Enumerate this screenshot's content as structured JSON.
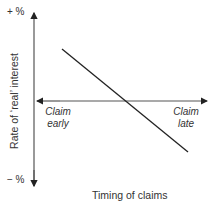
{
  "diagram": {
    "y_axis_label": "Rate of ‘real’ interest",
    "y_top_label": "+ %",
    "y_bottom_label": "− %",
    "x_axis_label": "Timing of claims",
    "x_left_label_line1": "Claim",
    "x_left_label_line2": "early",
    "x_right_label_line1": "Claim",
    "x_right_label_line2": "late",
    "line_description": "downward sloping line crossing the horizontal axis",
    "colors": {
      "axes": "#444444",
      "line": "#222222"
    }
  }
}
